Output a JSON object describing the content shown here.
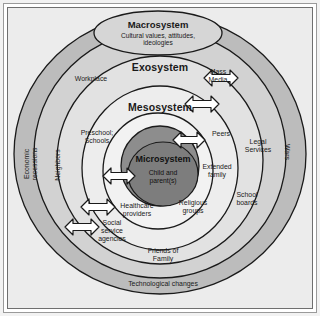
{
  "diagram": {
    "colors": {
      "page_background": "#ececec",
      "frame_outer": "#9a9a9a",
      "frame_inner": "#6f6f6f",
      "chronosystem_ring": "#bcbcbc",
      "macrosystem_ring": "#d2d2d2",
      "exosystem_ring": "#e4e4e4",
      "mesosystem_ring": "#efefef",
      "microsystem_fill": "#8f8f8f",
      "microsystem_inner": "#7e7e7e",
      "stroke": "#1a1a1a",
      "arrow_fill": "#ffffff",
      "text": "#1a1a1a"
    },
    "rings": [
      {
        "id": "macrosystem",
        "title": "Macrosystem",
        "subtitle": "Cultural values, attitudes,\nideologies"
      },
      {
        "id": "exosystem",
        "title": "Exosystem"
      },
      {
        "id": "mesosystem",
        "title": "Mesosystem"
      },
      {
        "id": "microsystem",
        "title": "Microsystem",
        "subtitle": "Child and\nparent(s)"
      }
    ],
    "labels": {
      "workplace": "Workplace",
      "mass_media": "Mass\nMedia",
      "preschool_schools": "Preschool;\nSchools",
      "peers": "Peers",
      "extended_family": "Extended\nfamily",
      "legal_services": "Legal\nServices",
      "economic_recessions": "Economic\nrecessions",
      "neighbors": "Neighbors",
      "wars": "Wars",
      "school_boards": "School\nboards",
      "religious_groups": "Religious\ngroups",
      "healthcare_providers": "Healthcare\nproviders",
      "social_service_agencies": "Social\nservice\nagencies",
      "friends_of_family": "Friends of\nFamily",
      "technological_changes": "Technological changes"
    },
    "arrows": [
      {
        "id": "arrow-mass-media",
        "direction": "bidirectional"
      },
      {
        "id": "arrow-peers-outer",
        "direction": "bidirectional"
      },
      {
        "id": "arrow-peers-inner",
        "direction": "bidirectional"
      },
      {
        "id": "arrow-microsystem-left",
        "direction": "bidirectional"
      },
      {
        "id": "arrow-healthcare",
        "direction": "bidirectional"
      },
      {
        "id": "arrow-social-service",
        "direction": "bidirectional"
      }
    ]
  }
}
